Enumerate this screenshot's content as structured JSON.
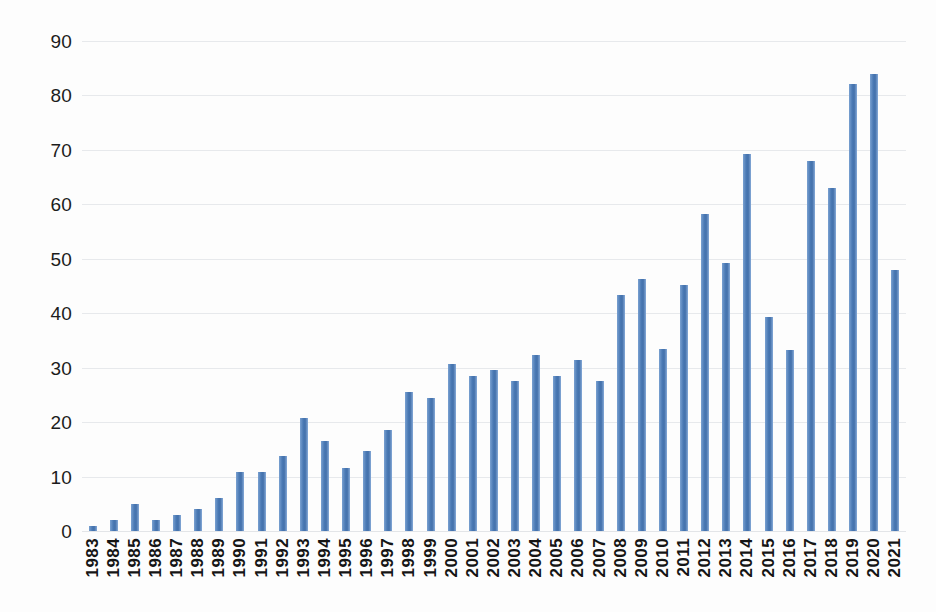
{
  "chart_data": {
    "type": "bar",
    "title": "",
    "xlabel": "",
    "ylabel": "",
    "ylim": [
      0,
      90
    ],
    "ytick_step": 10,
    "grid": true,
    "legend": "none",
    "bar_color": "#4a79b4",
    "gridline_color": "#e7e9ec",
    "axis_text_color": "#151515",
    "ytick_labels": [
      "90",
      "80",
      "70",
      "60",
      "50",
      "40",
      "30",
      "20",
      "10",
      "0"
    ],
    "ytick_values": [
      90,
      80,
      70,
      60,
      50,
      40,
      30,
      20,
      10,
      0
    ],
    "categories": [
      "1983",
      "1984",
      "1985",
      "1986",
      "1987",
      "1988",
      "1989",
      "1990",
      "1991",
      "1992",
      "1993",
      "1994",
      "1995",
      "1996",
      "1997",
      "1998",
      "1999",
      "2000",
      "2001",
      "2002",
      "2003",
      "2004",
      "2005",
      "2006",
      "2007",
      "2008",
      "2009",
      "2010",
      "2011",
      "2012",
      "2013",
      "2014",
      "2015",
      "2016",
      "2017",
      "2018",
      "2019",
      "2020",
      "2021"
    ],
    "values": [
      1.0,
      2.0,
      5.0,
      2.0,
      2.9,
      4.1,
      6.0,
      10.8,
      10.8,
      13.7,
      20.7,
      16.6,
      11.6,
      14.7,
      18.6,
      25.5,
      24.5,
      30.6,
      28.5,
      29.6,
      27.5,
      32.4,
      28.4,
      31.4,
      27.5,
      43.3,
      46.2,
      33.4,
      45.2,
      58.2,
      49.3,
      69.2,
      39.4,
      33.2,
      68.0,
      63.0,
      82.1,
      84.0,
      48.0
    ]
  },
  "caption": {
    "text": ""
  }
}
